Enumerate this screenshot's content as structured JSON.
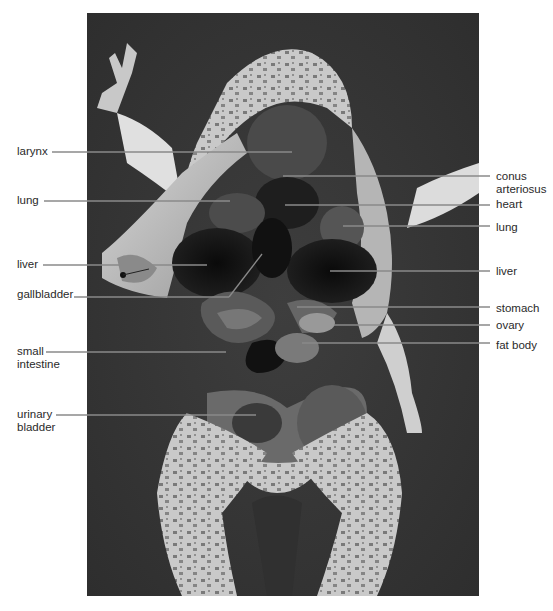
{
  "figure": {
    "photo_frame": {
      "x": 87,
      "y": 13,
      "width": 392,
      "height": 583
    }
  },
  "labels_left": [
    {
      "id": "larynx",
      "lines": [
        "larynx"
      ],
      "text_x": 17,
      "text_y": 145,
      "line_y": 152,
      "line_x1": 52,
      "line_x2": 292
    },
    {
      "id": "lung-left",
      "lines": [
        "lung"
      ],
      "text_x": 17,
      "text_y": 194,
      "line_y": 201,
      "line_x1": 44,
      "line_x2": 230
    },
    {
      "id": "liver-left",
      "lines": [
        "liver"
      ],
      "text_x": 17,
      "text_y": 258,
      "line_y": 265,
      "line_x1": 43,
      "line_x2": 207
    },
    {
      "id": "gallbladder",
      "lines": [
        "gallbladder"
      ],
      "text_x": 17,
      "text_y": 288,
      "line_y": 297,
      "line_x1": 74,
      "line_x2": 229
    },
    {
      "id": "small-intestine",
      "lines": [
        "small",
        "intestine"
      ],
      "text_x": 17,
      "text_y": 345,
      "line_y": 352,
      "line_x1": 46,
      "line_x2": 226
    },
    {
      "id": "urinary-bladder",
      "lines": [
        "urinary",
        "bladder"
      ],
      "text_x": 17,
      "text_y": 408,
      "line_y": 415,
      "line_x1": 56,
      "line_x2": 256
    }
  ],
  "labels_right": [
    {
      "id": "conus-arteriosus",
      "lines": [
        "conus",
        "arteriosus"
      ],
      "text_x": 496,
      "text_y": 170,
      "line_y": 176,
      "line_x1": 283,
      "line_x2": 490
    },
    {
      "id": "heart",
      "lines": [
        "heart"
      ],
      "text_x": 496,
      "text_y": 198,
      "line_y": 205,
      "line_x1": 285,
      "line_x2": 490
    },
    {
      "id": "lung-right",
      "lines": [
        "lung"
      ],
      "text_x": 496,
      "text_y": 221,
      "line_y": 226,
      "line_x1": 343,
      "line_x2": 490
    },
    {
      "id": "liver-right",
      "lines": [
        "liver"
      ],
      "text_x": 496,
      "text_y": 265,
      "line_y": 271,
      "line_x1": 330,
      "line_x2": 490
    },
    {
      "id": "stomach",
      "lines": [
        "stomach"
      ],
      "text_x": 496,
      "text_y": 302,
      "line_y": 307,
      "line_x1": 297,
      "line_x2": 490
    },
    {
      "id": "ovary",
      "lines": [
        "ovary"
      ],
      "text_x": 496,
      "text_y": 319,
      "line_y": 325,
      "line_x1": 334,
      "line_x2": 490
    },
    {
      "id": "fat-body",
      "lines": [
        "fat body"
      ],
      "text_x": 496,
      "text_y": 339,
      "line_y": 343,
      "line_x1": 302,
      "line_x2": 490
    }
  ],
  "gallbladder_diagonal": {
    "x1": 229,
    "y1": 297,
    "x2": 262,
    "y2": 254
  },
  "colors": {
    "background": "#ffffff",
    "photo_bg": "#3a3a3a",
    "leader_line": "#8a8a8a",
    "label_text": "#2a2a2a"
  }
}
